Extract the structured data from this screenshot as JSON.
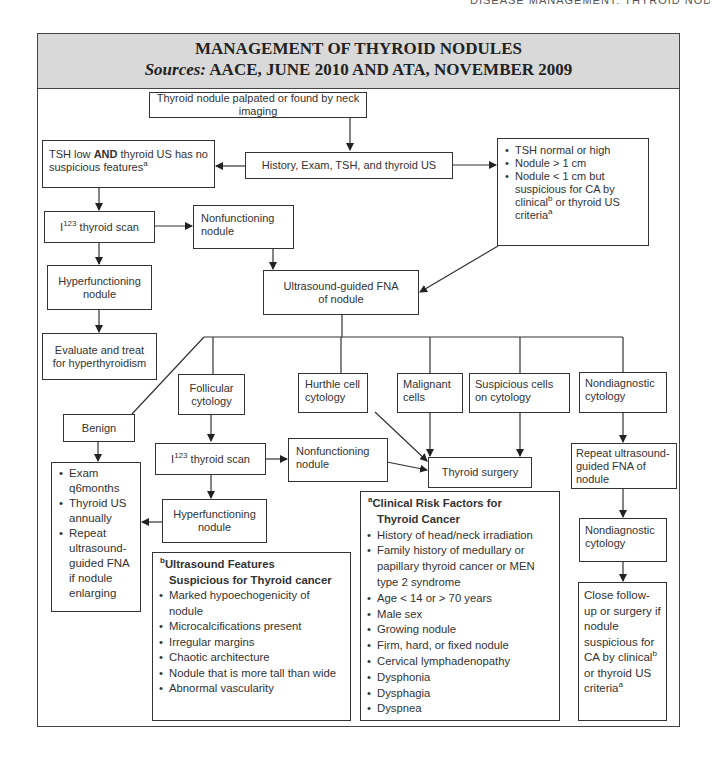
{
  "page": {
    "running_head": "DISEASE MANAGEMENT: THYROID NODULES MANAGEMENT   257"
  },
  "header": {
    "title": "MANAGEMENT OF THYROID NODULES",
    "sources_label": "Sources:",
    "sources_text": " AACE, JUNE 2010 AND ATA, NOVEMBER 2009"
  },
  "nodes": {
    "start": "Thyroid nodule palpated or found by neck imaging",
    "history": "History, Exam, TSH, and thyroid US",
    "tsh_low_a": "TSH low ",
    "tsh_low_and": "AND",
    "tsh_low_b": " thyroid US has no suspicious features",
    "tsh_low_sup": "a",
    "criteria_items": [
      "TSH normal or high",
      "Nodule > 1 cm",
      "Nodule < 1 cm but suspicious for CA by clinical"
    ],
    "criteria_sup_b": "b",
    "criteria_tail": " or thyroid US criteria",
    "criteria_sup_a": "a",
    "i123_scan_1_pre": "I",
    "i123_scan_1_sup": "123",
    "i123_scan_1_post": " thyroid scan",
    "nonfunctioning_1": "Nonfunctioning nodule",
    "hyperfunctioning_1": "Hyperfunctioning nodule",
    "evaluate_treat": "Evaluate and treat for hyperthyroidism",
    "us_fna": "Ultrasound-guided FNA of nodule",
    "benign": "Benign",
    "follicular": "Follicular cytology",
    "hurthle": "Hurthle cell cytology",
    "malignant": "Malignant cells",
    "suspicious": "Suspicious cells on cytology",
    "nondiagnostic_1": "Nondiagnostic cytology",
    "benign_followup": [
      "Exam q6months",
      "Thyroid US annually",
      "Repeat ultrasound-guided FNA if nodule enlarging"
    ],
    "i123_scan_2_pre": "I",
    "i123_scan_2_sup": "123",
    "i123_scan_2_post": " thyroid scan",
    "nonfunctioning_2": "Nonfunctioning nodule",
    "thyroid_surgery": "Thyroid surgery",
    "hyperfunctioning_2": "Hyperfunctioning nodule",
    "repeat_fna": "Repeat ultrasound-guided FNA of nodule",
    "nondiagnostic_2": "Nondiagnostic cytology",
    "close_followup_a": "Close follow-up or surgery if nodule suspicious for CA by clinical",
    "close_followup_sup_b": "b",
    "close_followup_b": " or thyroid US criteria",
    "close_followup_sup_a": "a"
  },
  "notes": {
    "us_features": {
      "marker": "b",
      "title_line1": "Ultrasound Features",
      "title_line2": "Suspicious for Thyroid cancer",
      "items": [
        "Marked hypoechogenicity of nodule",
        "Microcalcifications present",
        "Irregular margins",
        "Chaotic architecture",
        "Nodule that is more tall than wide",
        "Abnormal vascularity"
      ]
    },
    "clinical_risk": {
      "marker": "a",
      "title_line1": "Clinical Risk Factors for",
      "title_line2": "Thyroid Cancer",
      "items": [
        "History of head/neck irradiation",
        "Family history of medullary or papillary thyroid cancer or MEN type 2 syndrome",
        "Age < 14 or > 70 years",
        "Male sex",
        "Growing nodule",
        "Firm, hard, or fixed nodule",
        "Cervical lymphadenopathy",
        "Dysphonia",
        "Dysphagia",
        "Dyspnea"
      ]
    }
  },
  "colors": {
    "title_band": "#d9d9d9",
    "border": "#333333",
    "text": "#2a2a2a"
  }
}
